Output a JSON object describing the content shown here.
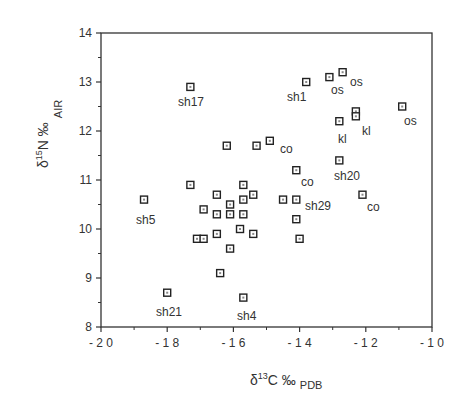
{
  "chart_data": {
    "type": "scatter",
    "title": "",
    "xlabel": "δ13C ‰ PDB",
    "ylabel": "δ15N ‰ AIR",
    "xlim": [
      -20,
      -10
    ],
    "ylim": [
      8,
      14
    ],
    "xticks": [
      -20,
      -18,
      -16,
      -14,
      -12,
      -10
    ],
    "xtick_labels": [
      "-20",
      "-18",
      "-16",
      "-14",
      "-12",
      "-10"
    ],
    "yticks": [
      8,
      9,
      10,
      11,
      12,
      13,
      14
    ],
    "ytick_labels": [
      "8",
      "9",
      "10",
      "11",
      "12",
      "13",
      "14"
    ],
    "grid": false,
    "legend": null,
    "marker": "square",
    "points": [
      {
        "x": -17.3,
        "y": 12.9,
        "label": "sh17"
      },
      {
        "x": -16.2,
        "y": 11.7,
        "label": ""
      },
      {
        "x": -15.3,
        "y": 11.7,
        "label": ""
      },
      {
        "x": -14.9,
        "y": 11.8,
        "label": "co"
      },
      {
        "x": -13.8,
        "y": 13.0,
        "label": "sh1"
      },
      {
        "x": -13.1,
        "y": 13.1,
        "label": "os"
      },
      {
        "x": -12.7,
        "y": 13.2,
        "label": "os"
      },
      {
        "x": -12.8,
        "y": 12.2,
        "label": "kl"
      },
      {
        "x": -12.3,
        "y": 12.4,
        "label": "kl"
      },
      {
        "x": -12.3,
        "y": 12.3,
        "label": ""
      },
      {
        "x": -10.9,
        "y": 12.5,
        "label": "os"
      },
      {
        "x": -14.1,
        "y": 11.2,
        "label": "co"
      },
      {
        "x": -12.8,
        "y": 11.4,
        "label": "sh20"
      },
      {
        "x": -14.5,
        "y": 10.6,
        "label": ""
      },
      {
        "x": -14.1,
        "y": 10.6,
        "label": "sh29"
      },
      {
        "x": -12.1,
        "y": 10.7,
        "label": "co"
      },
      {
        "x": -14.1,
        "y": 10.2,
        "label": ""
      },
      {
        "x": -14.0,
        "y": 9.8,
        "label": ""
      },
      {
        "x": -18.7,
        "y": 10.6,
        "label": "sh5"
      },
      {
        "x": -17.3,
        "y": 10.9,
        "label": ""
      },
      {
        "x": -15.7,
        "y": 10.9,
        "label": ""
      },
      {
        "x": -16.5,
        "y": 10.7,
        "label": ""
      },
      {
        "x": -15.4,
        "y": 10.7,
        "label": ""
      },
      {
        "x": -16.1,
        "y": 10.5,
        "label": ""
      },
      {
        "x": -15.7,
        "y": 10.6,
        "label": ""
      },
      {
        "x": -16.9,
        "y": 10.4,
        "label": ""
      },
      {
        "x": -16.5,
        "y": 10.3,
        "label": ""
      },
      {
        "x": -16.1,
        "y": 10.3,
        "label": ""
      },
      {
        "x": -15.7,
        "y": 10.3,
        "label": ""
      },
      {
        "x": -15.8,
        "y": 10.0,
        "label": ""
      },
      {
        "x": -15.4,
        "y": 9.9,
        "label": ""
      },
      {
        "x": -17.1,
        "y": 9.8,
        "label": ""
      },
      {
        "x": -16.9,
        "y": 9.8,
        "label": ""
      },
      {
        "x": -16.5,
        "y": 9.9,
        "label": ""
      },
      {
        "x": -16.1,
        "y": 9.6,
        "label": ""
      },
      {
        "x": -16.4,
        "y": 9.1,
        "label": ""
      },
      {
        "x": -18.0,
        "y": 8.7,
        "label": "sh21"
      },
      {
        "x": -15.7,
        "y": 8.6,
        "label": "sh4"
      }
    ],
    "annotations": [
      {
        "text": "sh17",
        "px": 178,
        "py": 106
      },
      {
        "text": "co",
        "px": 280,
        "py": 153
      },
      {
        "text": "sh1",
        "px": 287,
        "py": 101
      },
      {
        "text": "os",
        "px": 331,
        "py": 94
      },
      {
        "text": "os",
        "px": 350,
        "py": 86
      },
      {
        "text": "kl",
        "px": 338,
        "py": 143
      },
      {
        "text": "kl",
        "px": 362,
        "py": 135
      },
      {
        "text": "os",
        "px": 404,
        "py": 125
      },
      {
        "text": "co",
        "px": 301,
        "py": 186
      },
      {
        "text": "sh20",
        "px": 334,
        "py": 180
      },
      {
        "text": "sh29",
        "px": 305,
        "py": 210
      },
      {
        "text": "co",
        "px": 367,
        "py": 211
      },
      {
        "text": "sh5",
        "px": 136,
        "py": 224
      },
      {
        "text": "sh21",
        "px": 156,
        "py": 316
      },
      {
        "text": "sh4",
        "px": 237,
        "py": 320
      }
    ]
  },
  "axes": {
    "x_title_main": "δ",
    "x_title_sup": "13",
    "x_title_rest": "C ‰",
    "x_title_sub": "PDB",
    "y_title_main": "δ",
    "y_title_sup": "15",
    "y_title_rest": "N ‰",
    "y_title_sub": "AIR"
  }
}
